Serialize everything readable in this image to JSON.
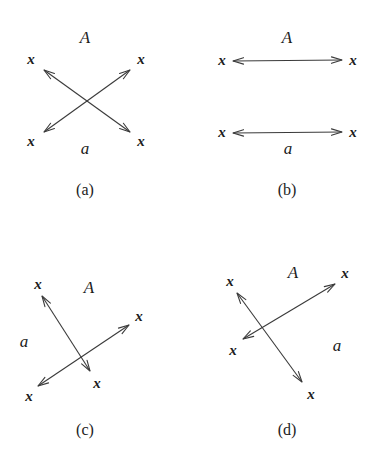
{
  "figure": {
    "width": 370,
    "height": 471,
    "background": "#ffffff",
    "stroke_color": "#3a3a3a",
    "text_color": "#1c1c1c"
  },
  "panels": [
    {
      "id": "panel-a",
      "caption": "(a)",
      "caption_pos": {
        "x": 85,
        "y": 190
      },
      "region_labels": [
        {
          "name": "label-A",
          "text": "A",
          "x": 85,
          "y": 37
        },
        {
          "name": "label-a",
          "text": "a",
          "x": 85,
          "y": 148
        }
      ],
      "arrows": [
        {
          "name": "arrow-upleft-downright",
          "x1": 44,
          "y1": 70,
          "x2": 130,
          "y2": 132
        },
        {
          "name": "arrow-downleft-upright",
          "x1": 44,
          "y1": 132,
          "x2": 130,
          "y2": 70
        }
      ],
      "endpoint_labels": [
        {
          "name": "endpoint-label-top-left",
          "text": "x",
          "x": 31,
          "y": 59
        },
        {
          "name": "endpoint-label-top-right",
          "text": "x",
          "x": 141,
          "y": 59
        },
        {
          "name": "endpoint-label-bottom-left",
          "text": "x",
          "x": 31,
          "y": 141
        },
        {
          "name": "endpoint-label-bottom-right",
          "text": "x",
          "x": 141,
          "y": 141
        }
      ]
    },
    {
      "id": "panel-b",
      "caption": "(b)",
      "caption_pos": {
        "x": 287,
        "y": 190
      },
      "region_labels": [
        {
          "name": "label-A",
          "text": "A",
          "x": 287,
          "y": 37
        },
        {
          "name": "label-a",
          "text": "a",
          "x": 288,
          "y": 148
        }
      ],
      "arrows": [
        {
          "name": "arrow-top-horizontal",
          "x1": 233,
          "y1": 61,
          "x2": 342,
          "y2": 60
        },
        {
          "name": "arrow-bottom-horizontal",
          "x1": 233,
          "y1": 133,
          "x2": 342,
          "y2": 132
        }
      ],
      "endpoint_labels": [
        {
          "name": "endpoint-label-top-left",
          "text": "x",
          "x": 222,
          "y": 60
        },
        {
          "name": "endpoint-label-top-right",
          "text": "x",
          "x": 353,
          "y": 60
        },
        {
          "name": "endpoint-label-bottom-left",
          "text": "x",
          "x": 222,
          "y": 132
        },
        {
          "name": "endpoint-label-bottom-right",
          "text": "x",
          "x": 353,
          "y": 132
        }
      ]
    },
    {
      "id": "panel-c",
      "caption": "(c)",
      "caption_pos": {
        "x": 85,
        "y": 430
      },
      "region_labels": [
        {
          "name": "label-A",
          "text": "A",
          "x": 89,
          "y": 287
        },
        {
          "name": "label-a",
          "text": "a",
          "x": 24,
          "y": 341
        }
      ],
      "arrows": [
        {
          "name": "arrow-steep",
          "x1": 42,
          "y1": 296,
          "x2": 90,
          "y2": 371
        },
        {
          "name": "arrow-shallow",
          "x1": 38,
          "y1": 386,
          "x2": 129,
          "y2": 325
        }
      ],
      "endpoint_labels": [
        {
          "name": "endpoint-label-top-left",
          "text": "x",
          "x": 38,
          "y": 284
        },
        {
          "name": "endpoint-label-right",
          "text": "x",
          "x": 139,
          "y": 316
        },
        {
          "name": "endpoint-label-bottom-left",
          "text": "x",
          "x": 29,
          "y": 396
        },
        {
          "name": "endpoint-label-bottom-mid",
          "text": "x",
          "x": 97,
          "y": 383
        }
      ]
    },
    {
      "id": "panel-d",
      "caption": "(d)",
      "caption_pos": {
        "x": 287,
        "y": 430
      },
      "region_labels": [
        {
          "name": "label-A",
          "text": "A",
          "x": 293,
          "y": 272
        },
        {
          "name": "label-a",
          "text": "a",
          "x": 337,
          "y": 345
        }
      ],
      "arrows": [
        {
          "name": "arrow-steep",
          "x1": 237,
          "y1": 293,
          "x2": 302,
          "y2": 382
        },
        {
          "name": "arrow-shallow",
          "x1": 243,
          "y1": 339,
          "x2": 335,
          "y2": 284
        }
      ],
      "endpoint_labels": [
        {
          "name": "endpoint-label-top-left",
          "text": "x",
          "x": 230,
          "y": 281
        },
        {
          "name": "endpoint-label-top-right",
          "text": "x",
          "x": 345,
          "y": 273
        },
        {
          "name": "endpoint-label-left",
          "text": "x",
          "x": 233,
          "y": 350
        },
        {
          "name": "endpoint-label-bottom",
          "text": "x",
          "x": 311,
          "y": 394
        }
      ]
    }
  ]
}
